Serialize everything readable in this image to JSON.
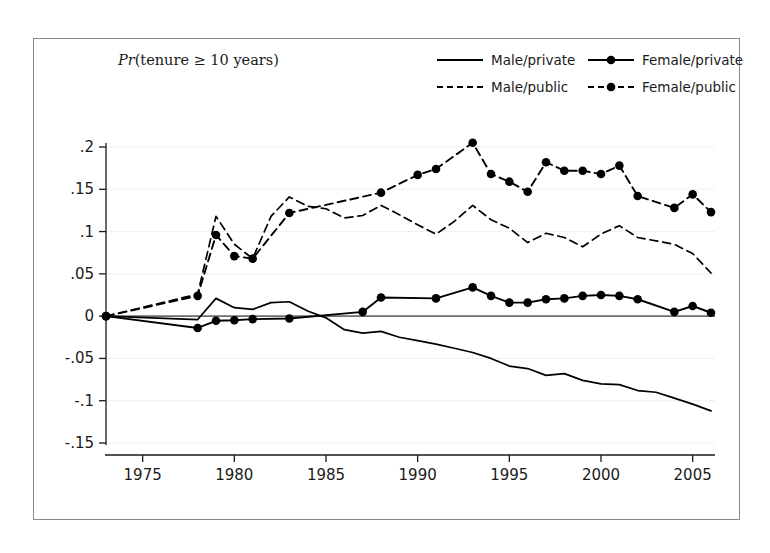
{
  "figure": {
    "title": "Pr(tenure ≥ 10 years)",
    "title_prefix_italic": "Pr",
    "title_rest": "(tenure ≥ 10 years)"
  },
  "legend": {
    "position": "top-right",
    "entries": [
      {
        "label": "Male/private",
        "style": "solid",
        "marker": "none",
        "color": "#000000"
      },
      {
        "label": "Female/private",
        "style": "solid",
        "marker": "circle",
        "color": "#000000"
      },
      {
        "label": "Male/public",
        "style": "dashed",
        "marker": "none",
        "color": "#000000"
      },
      {
        "label": "Female/public",
        "style": "dashed",
        "marker": "circle",
        "color": "#000000"
      }
    ]
  },
  "chart_data": {
    "type": "line",
    "title": "Pr(tenure ≥ 10 years)",
    "xlabel": "",
    "ylabel": "",
    "xlim": [
      1973,
      2006
    ],
    "ylim": [
      -0.15,
      0.21
    ],
    "xticks": [
      1975,
      1980,
      1985,
      1990,
      1995,
      2000,
      2005
    ],
    "xticklabels": [
      "1975",
      "1980",
      "1985",
      "1990",
      "1995",
      "2000",
      "2005"
    ],
    "yticks": [
      0.2,
      0.15,
      0.1,
      0.05,
      0,
      -0.05,
      -0.1,
      -0.15
    ],
    "yticklabels": [
      ".2",
      ".15",
      ".1",
      ".05",
      "0",
      "-.05",
      "-.1",
      "-.15"
    ],
    "grid": "horizontal-faint",
    "zero_line": true,
    "series": [
      {
        "name": "Male/private",
        "style": "solid",
        "marker": "none",
        "color": "#000000",
        "x": [
          1973,
          1978,
          1979,
          1980,
          1981,
          1982,
          1983,
          1984,
          1985,
          1986,
          1987,
          1988,
          1989,
          1990,
          1991,
          1992,
          1993,
          1994,
          1995,
          1996,
          1997,
          1998,
          1999,
          2000,
          2001,
          2002,
          2003,
          2004,
          2005,
          2006
        ],
        "y": [
          0.0,
          -0.004,
          0.021,
          0.01,
          0.008,
          0.016,
          0.017,
          0.006,
          -0.002,
          -0.016,
          -0.02,
          -0.018,
          -0.025,
          -0.029,
          -0.033,
          -0.038,
          -0.043,
          -0.05,
          -0.059,
          -0.062,
          -0.07,
          -0.068,
          -0.076,
          -0.08,
          -0.081,
          -0.088,
          -0.09,
          -0.097,
          -0.104,
          -0.112
        ]
      },
      {
        "name": "Male/public",
        "style": "dashed",
        "marker": "none",
        "color": "#000000",
        "x": [
          1973,
          1978,
          1979,
          1980,
          1981,
          1982,
          1983,
          1984,
          1985,
          1986,
          1987,
          1988,
          1989,
          1990,
          1991,
          1992,
          1993,
          1994,
          1995,
          1996,
          1997,
          1998,
          1999,
          2000,
          2001,
          2002,
          2003,
          2004,
          2005,
          2006
        ],
        "y": [
          0.0,
          0.026,
          0.118,
          0.085,
          0.068,
          0.118,
          0.141,
          0.13,
          0.127,
          0.116,
          0.119,
          0.131,
          0.12,
          0.108,
          0.097,
          0.112,
          0.131,
          0.114,
          0.104,
          0.087,
          0.098,
          0.093,
          0.082,
          0.097,
          0.107,
          0.093,
          0.089,
          0.085,
          0.074,
          0.051
        ]
      },
      {
        "name": "Female/private",
        "style": "solid",
        "marker": "circle",
        "color": "#000000",
        "x": [
          1973,
          1978,
          1979,
          1980,
          1981,
          1983,
          1987,
          1988,
          1991,
          1993,
          1994,
          1995,
          1996,
          1997,
          1998,
          1999,
          2000,
          2001,
          2002,
          2004,
          2005,
          2006
        ],
        "y": [
          0.0,
          -0.014,
          -0.0055,
          -0.0048,
          -0.0035,
          -0.0028,
          0.005,
          0.022,
          0.021,
          0.034,
          0.024,
          0.016,
          0.016,
          0.02,
          0.021,
          0.024,
          0.025,
          0.024,
          0.02,
          0.005,
          0.012,
          0.004
        ]
      },
      {
        "name": "Female/public",
        "style": "dashed",
        "marker": "circle",
        "color": "#000000",
        "x": [
          1973,
          1978,
          1979,
          1980,
          1981,
          1983,
          1988,
          1990,
          1991,
          1993,
          1994,
          1995,
          1996,
          1997,
          1998,
          1999,
          2000,
          2001,
          2002,
          2004,
          2005,
          2006
        ],
        "y": [
          0.0,
          0.024,
          0.096,
          0.071,
          0.068,
          0.122,
          0.146,
          0.167,
          0.174,
          0.205,
          0.168,
          0.159,
          0.147,
          0.182,
          0.172,
          0.172,
          0.168,
          0.178,
          0.142,
          0.128,
          0.144,
          0.123
        ]
      }
    ]
  }
}
